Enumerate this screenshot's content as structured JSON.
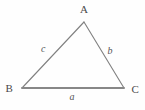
{
  "figure": {
    "kind": "triangle-diagram",
    "background_color": "#fefefe",
    "stroke_color": "#808080",
    "base_stroke_color": "#878787",
    "label_color": "#4a4a4a",
    "side_label_color": "#555555",
    "vertices": [
      {
        "id": "A",
        "label": "A",
        "x": 84,
        "y": 22
      },
      {
        "id": "B",
        "label": "B",
        "x": 22,
        "y": 88
      },
      {
        "id": "C",
        "label": "C",
        "x": 124,
        "y": 88
      }
    ],
    "sides": [
      {
        "id": "a",
        "label": "a",
        "from": "B",
        "to": "C",
        "label_x": 72,
        "label_y": 97
      },
      {
        "id": "b",
        "label": "b",
        "from": "A",
        "to": "C",
        "label_x": 110,
        "label_y": 51
      },
      {
        "id": "c",
        "label": "c",
        "from": "A",
        "to": "B",
        "label_x": 43,
        "label_y": 49
      }
    ],
    "vertex_labels": {
      "A": "A",
      "B": "B",
      "C": "C"
    },
    "side_labels": {
      "a": "a",
      "b": "b",
      "c": "c"
    }
  }
}
